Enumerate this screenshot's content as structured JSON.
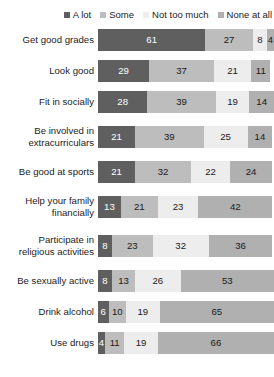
{
  "legend": {
    "items": [
      {
        "label": "A lot",
        "color": "#5f5f5f",
        "icon": "legend-square-icon"
      },
      {
        "label": "Some",
        "color": "#bdbdbd",
        "icon": "legend-square-icon"
      },
      {
        "label": "Not too much",
        "color": "#ededed",
        "icon": "legend-square-icon"
      },
      {
        "label": "None at all",
        "color": "#b0b0b0",
        "icon": "legend-square-icon"
      }
    ]
  },
  "chart_data": {
    "type": "bar",
    "orientation": "horizontal",
    "stacked": true,
    "stack_total": 100,
    "units": "percent",
    "title": "",
    "subtitle": "",
    "xlabel": "",
    "ylabel": "",
    "xlim": [
      0,
      100
    ],
    "grid": false,
    "legend_position": "top-right",
    "value_labels": true,
    "categories": [
      "Get good grades",
      "Look good",
      "Fit in socially",
      "Be involved in\nextracurriculars",
      "Be good at sports",
      "Help your family\nfinancially",
      "Participate in\nreligious activities",
      "Be sexually active",
      "Drink alcohol",
      "Use drugs"
    ],
    "series": [
      {
        "name": "A lot",
        "color": "#5f5f5f",
        "values": [
          61,
          29,
          28,
          21,
          21,
          13,
          8,
          8,
          6,
          4
        ]
      },
      {
        "name": "Some",
        "color": "#bdbdbd",
        "values": [
          27,
          37,
          39,
          39,
          32,
          21,
          23,
          13,
          10,
          11
        ]
      },
      {
        "name": "Not too much",
        "color": "#ededed",
        "values": [
          8,
          21,
          19,
          25,
          22,
          23,
          32,
          26,
          19,
          19
        ]
      },
      {
        "name": "None at all",
        "color": "#b0b0b0",
        "values": [
          4,
          11,
          14,
          14,
          24,
          42,
          36,
          53,
          65,
          66
        ]
      }
    ]
  }
}
